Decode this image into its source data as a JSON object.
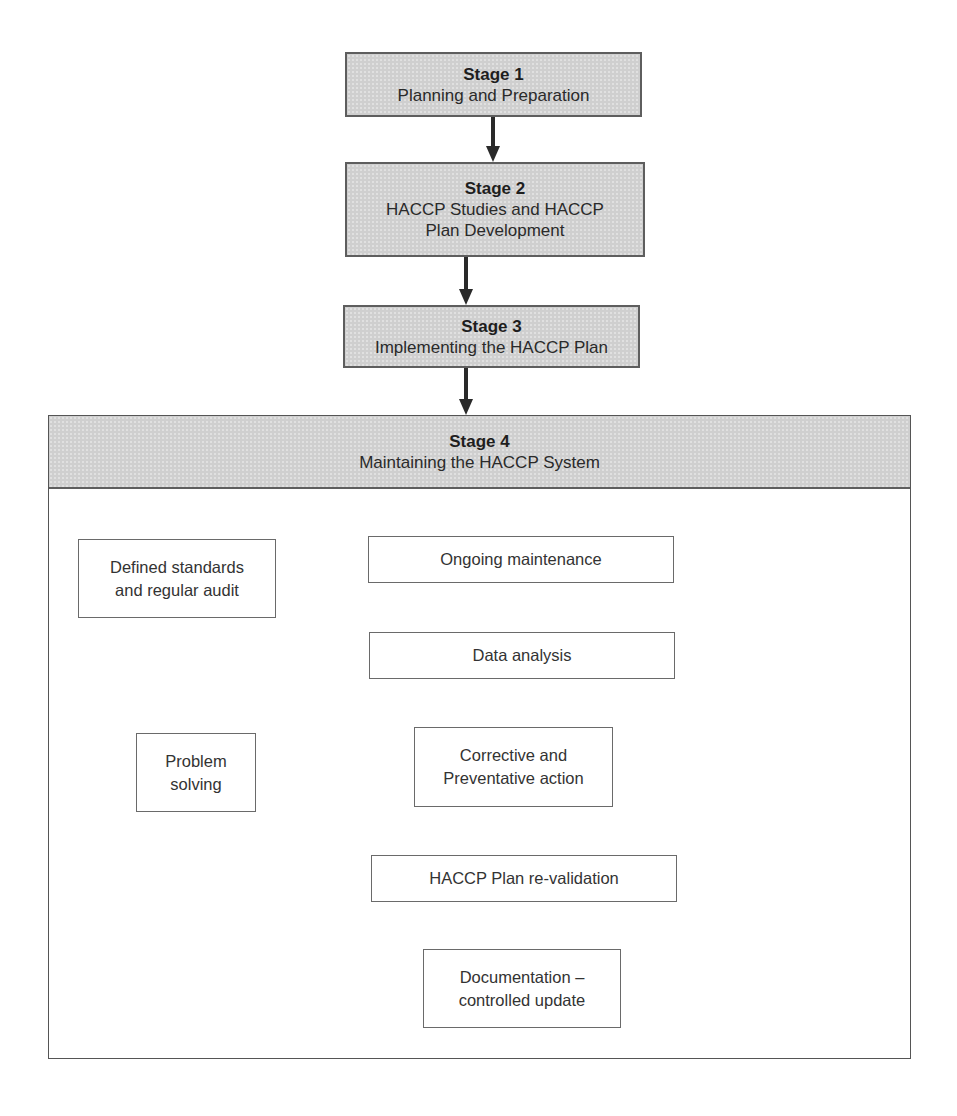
{
  "stages": [
    {
      "title": "Stage 1",
      "subtitle_lines": [
        "Planning and Preparation"
      ]
    },
    {
      "title": "Stage 2",
      "subtitle_lines": [
        "HACCP Studies and HACCP",
        "Plan Development"
      ]
    },
    {
      "title": "Stage 3",
      "subtitle_lines": [
        "Implementing the HACCP Plan"
      ]
    },
    {
      "title": "Stage 4",
      "subtitle_lines": [
        "Maintaining the HACCP System"
      ]
    }
  ],
  "stage4_flow": {
    "defined_standards": [
      "Defined standards",
      "and regular audit"
    ],
    "ongoing_maintenance": [
      "Ongoing maintenance"
    ],
    "data_analysis": [
      "Data analysis"
    ],
    "problem_solving": [
      "Problem",
      "solving"
    ],
    "corrective_action": [
      "Corrective and",
      "Preventative action"
    ],
    "plan_revalidation": [
      "HACCP Plan re-validation"
    ],
    "documentation": [
      "Documentation –",
      "controlled update"
    ]
  },
  "connections": [
    {
      "from": "Stage 1",
      "to": "Stage 2"
    },
    {
      "from": "Stage 2",
      "to": "Stage 3"
    },
    {
      "from": "Stage 3",
      "to": "Stage 4"
    },
    {
      "from": "Defined standards and regular audit",
      "to": "Ongoing maintenance"
    },
    {
      "from": "Ongoing maintenance",
      "to": "Data analysis"
    },
    {
      "from": "Data analysis",
      "to": "Corrective and Preventative action"
    },
    {
      "from": "Problem solving",
      "to": "Corrective and Preventative action"
    },
    {
      "from": "Corrective and Preventative action",
      "to": "HACCP Plan re-validation"
    },
    {
      "from": "HACCP Plan re-validation",
      "to": "Documentation – controlled update"
    },
    {
      "from": "Documentation – controlled update",
      "to": "Ongoing maintenance"
    }
  ],
  "colors": {
    "stage_fill": "#cfcfcf",
    "stage_border": "#5e5e5e",
    "line": "#3a3a3a",
    "text": "#2a2a2a"
  }
}
